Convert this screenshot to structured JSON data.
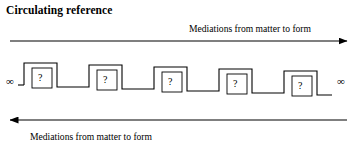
{
  "figure": {
    "title": "Circulating reference",
    "width": 357,
    "height": 157,
    "background_color": "#ffffff",
    "line_color": "#000000"
  },
  "top_arrow": {
    "label": "Mediations from matter to form",
    "direction": "right",
    "arrowhead": "right-arrowhead-icon",
    "y": 41,
    "x_start": 10,
    "x_end": 347
  },
  "bottom_arrow": {
    "label": "Mediations from matter to form",
    "direction": "left",
    "arrowhead": "left-arrowhead-icon",
    "y": 120,
    "x_start": 347,
    "x_end": 10
  },
  "endpoints": {
    "left_symbol": "∞",
    "right_symbol": "∞"
  },
  "staircase": {
    "description": "Descending square-wave staircase of mediation steps",
    "step_count": 5,
    "step_label": "?",
    "steps": [
      {
        "label": "?",
        "box_x": 32,
        "box_y": 68,
        "box_w": 20,
        "box_h": 20
      },
      {
        "label": "?",
        "box_x": 97,
        "box_y": 70,
        "box_w": 20,
        "box_h": 20
      },
      {
        "label": "?",
        "box_x": 162,
        "box_y": 72,
        "box_w": 20,
        "box_h": 20
      },
      {
        "label": "?",
        "box_x": 227,
        "box_y": 74,
        "box_w": 20,
        "box_h": 20
      },
      {
        "label": "?",
        "box_x": 292,
        "box_y": 76,
        "box_w": 20,
        "box_h": 20
      }
    ],
    "path": "M 24,85 L 24,63 L 57,63 L 57,87 L 89,87 L 89,65 L 122,65 L 122,89 L 154,89 L 154,67 L 187,67 L 187,91 L 219,91 L 219,69 L 252,69 L 252,93 L 284,93 L 284,71 L 317,71 L 317,95 L 332,95",
    "left_cap_x1": 24,
    "left_cap_y": 85,
    "left_cap_x2": 18
  }
}
